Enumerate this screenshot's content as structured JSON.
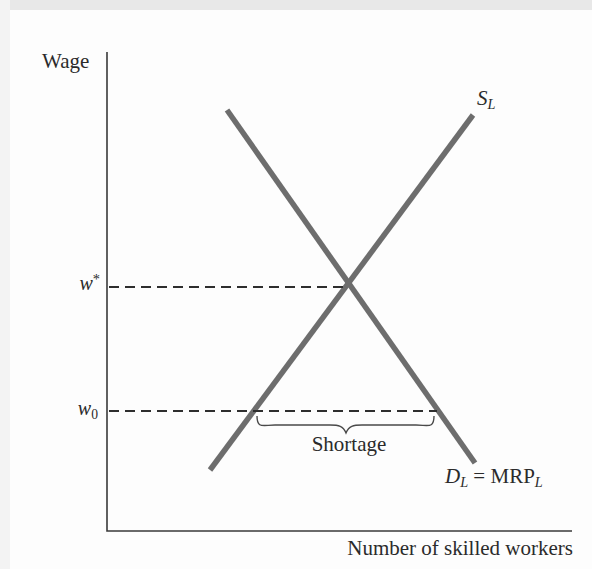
{
  "figure": {
    "y_axis_label": "Wage",
    "x_axis_label": "Number of skilled workers",
    "supply_label": {
      "main": "S",
      "sub": "L"
    },
    "demand_label": {
      "d": "D",
      "d_sub": "L",
      "eq": " = ",
      "mrp": "MRP",
      "mrp_sub": "L"
    },
    "equilibrium_wage_label": {
      "main": "w",
      "sup": "*"
    },
    "floor_wage_label": {
      "main": "w",
      "sub": "0"
    },
    "shortage_label": "Shortage"
  },
  "colors": {
    "background": "#fdfdfd",
    "scan_edge_top": "#e8e8e8",
    "scan_edge_left": "#f3f3f3",
    "curve": "#6d6d6d",
    "axis": "#3a3a3a",
    "dash": "#2e2e2e",
    "brace": "#4a4a4a",
    "text": "#2b2b2b"
  },
  "chart_data": {
    "type": "line",
    "title": "",
    "xlabel": "Number of skilled workers",
    "ylabel": "Wage",
    "axes_numeric": false,
    "grid": false,
    "series": [
      {
        "name": "S_L",
        "role": "labor-supply",
        "points_px": [
          [
            210,
            470
          ],
          [
            473,
            115
          ]
        ]
      },
      {
        "name": "D_L = MRP_L",
        "role": "labor-demand",
        "points_px": [
          [
            227,
            110
          ],
          [
            475,
            463
          ]
        ]
      }
    ],
    "reference_lines": [
      {
        "label": "w*",
        "meaning": "equilibrium wage",
        "style": "dashed",
        "y_px": 287,
        "x_from_px": 109,
        "x_to_px": 348
      },
      {
        "label": "w0",
        "meaning": "below-equilibrium wage",
        "style": "dashed",
        "y_px": 411,
        "x_from_px": 109,
        "x_to_px": 437
      }
    ],
    "annotations": [
      {
        "label": "Shortage",
        "type": "underbrace",
        "x_from_px": 257,
        "x_to_px": 434,
        "y_px": 416
      }
    ],
    "geometry": {
      "axes_points": "107,52 107,531 572,531",
      "curve_width": 5.5,
      "axis_width": 1.6,
      "dash_width": 2.2,
      "dash_pattern": "10 6",
      "intersection_px": [
        348,
        287
      ]
    }
  }
}
